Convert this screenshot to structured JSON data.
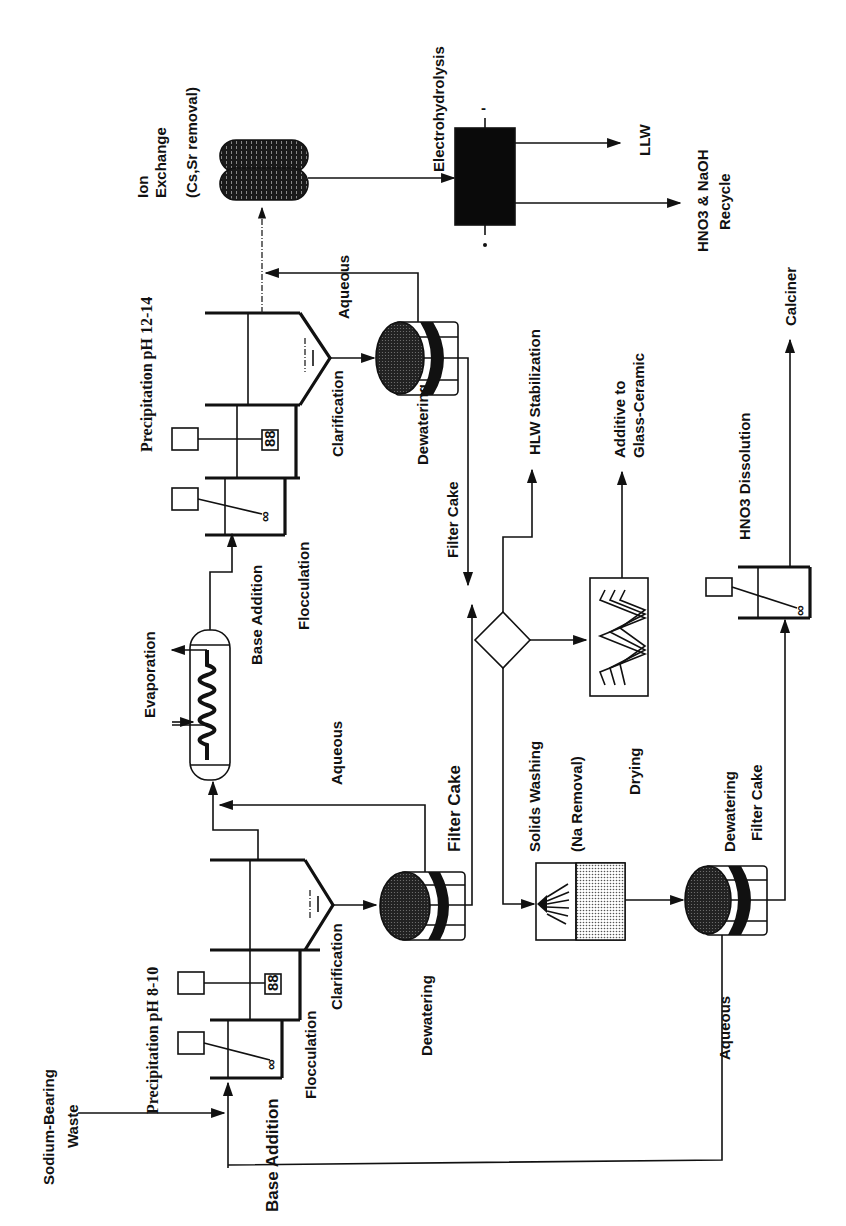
{
  "diagram": {
    "type": "process-flow",
    "orientation": "rotated-90-ccw",
    "colors": {
      "ink": "#111111",
      "background": "#ffffff"
    },
    "labels": {
      "sodium_bearing_waste_1": "Sodium-Bearing",
      "sodium_bearing_waste_2": "Waste",
      "base_addition_1": "Base Addition",
      "flocculation_1": "Flocculation",
      "precipitation_1": "Precipitation pH 8-10",
      "clarification_1": "Clarification",
      "dewatering_1": "Dewatering",
      "filter_cake_1": "Filter Cake",
      "aqueous_1": "Aqueous",
      "evaporation": "Evaporation",
      "base_addition_2": "Base Addition",
      "flocculation_2": "Flocculation",
      "precipitation_2": "Precipitation pH 12-14",
      "clarification_2": "Clarification",
      "dewatering_2": "Dewatering",
      "filter_cake_2": "Filter Cake",
      "aqueous_2": "Aqueous",
      "ion_exchange_1": "Ion",
      "ion_exchange_2": "Exchange",
      "ion_exchange_3": "(Cs,Sr removal)",
      "electrohydrolysis": "Electrohydrolysis",
      "llw": "LLW",
      "recycle_1": "HNO3 & NaOH",
      "recycle_2": "Recycle",
      "hlw_stabilization": "HLW Stabilization",
      "additive_1": "Additive to",
      "additive_2": "Glass-Ceramic",
      "solids_washing_1": "Solids Washing",
      "solids_washing_2": "(Na Removal)",
      "drying": "Drying",
      "dewatering_3": "Dewatering",
      "filter_cake_3": "Filter Cake",
      "aqueous_3": "Aqueous",
      "hno3_dissolution": "HNO3 Dissolution",
      "calciner": "Calciner",
      "electrode_minus": "-",
      "electrode_plus": "+"
    },
    "nodes": [
      "Sodium-Bearing Waste",
      "Base Addition / Flocculation tank (pH 8-10)",
      "Precipitation tank pH 8-10",
      "Clarifier 1",
      "Dewatering filter 1",
      "Evaporation",
      "Base Addition / Flocculation tank (pH 12-14)",
      "Precipitation tank pH 12-14",
      "Clarifier 2",
      "Dewatering filter 2",
      "Ion Exchange (Cs,Sr removal)",
      "Electrohydrolysis",
      "Splitter",
      "Solids Washing (Na Removal)",
      "Dryer",
      "Dewatering filter 3",
      "HNO3 Dissolution",
      "Calciner",
      "LLW",
      "HNO3 & NaOH Recycle",
      "HLW Stabilization",
      "Additive to Glass-Ceramic"
    ]
  }
}
